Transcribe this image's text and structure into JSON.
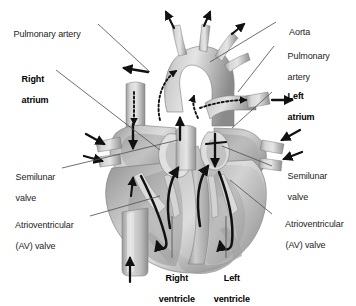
{
  "figure": {
    "style": "grayscale medical illustration",
    "colors": {
      "background": "#ffffff",
      "text": "#232323",
      "text_bold": "#000000",
      "leader_line": "#4a4a4a",
      "arrow_solid": "#111111",
      "arrow_dotted": "#111111",
      "tissue_light": "#e2e2e2",
      "tissue_mid": "#b9b9b9",
      "tissue_dark": "#8e8e8e",
      "tissue_darkest": "#6e6e6e"
    }
  },
  "labels": {
    "pulmonary_artery_left": {
      "lines": "Pulmonary artery",
      "weight": "regular",
      "side": "left"
    },
    "right_atrium": {
      "line1": "Right",
      "line2": "atrium",
      "weight": "bold",
      "side": "left"
    },
    "semilunar_valve_left": {
      "line1": "Semilunar",
      "line2": "valve",
      "weight": "regular",
      "side": "left"
    },
    "av_valve_left": {
      "line1": "Atrioventricular",
      "line2": "(AV) valve",
      "weight": "regular",
      "side": "left"
    },
    "aorta": {
      "lines": "Aorta",
      "weight": "regular",
      "side": "right"
    },
    "pulmonary_artery_right": {
      "line1": "Pulmonary",
      "line2": "artery",
      "weight": "regular",
      "side": "right"
    },
    "left_atrium": {
      "line1": "Left",
      "line2": "atrium",
      "weight": "bold",
      "side": "right"
    },
    "semilunar_valve_right": {
      "line1": "Semilunar",
      "line2": "valve",
      "weight": "regular",
      "side": "right"
    },
    "av_valve_right": {
      "line1": "Atrioventricular",
      "line2": "(AV) valve",
      "weight": "regular",
      "side": "right"
    },
    "right_ventricle": {
      "line1": "Right",
      "line2": "ventricle",
      "weight": "bold",
      "side": "bottom"
    },
    "left_ventricle": {
      "line1": "Left",
      "line2": "ventricle",
      "weight": "bold",
      "side": "bottom"
    }
  },
  "annotations": {
    "flow_arrows_solid_count": 16,
    "flow_arrows_dotted_count": 4,
    "inflow_arrows_left": 2,
    "inflow_arrows_right": 2,
    "outflow_arrows_top": 3,
    "inferior_vena_cava_arrow": "upward"
  }
}
